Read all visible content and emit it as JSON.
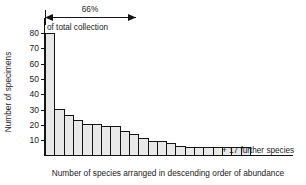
{
  "chart_data": {
    "type": "bar",
    "title": "",
    "xlabel": "Number of species arranged in descending order of abundance",
    "ylabel": "Number of specimens",
    "ylim": [
      0,
      84
    ],
    "xlim": [
      0,
      24
    ],
    "grid": false,
    "legend": null,
    "yticks": [
      10,
      20,
      30,
      40,
      50,
      60,
      70,
      80
    ],
    "ytick_labels": [
      "10",
      "20",
      "30",
      "40",
      "50",
      "60",
      "70",
      "80"
    ],
    "xtick_labels": [],
    "categories": [
      "1",
      "2",
      "3",
      "4",
      "5",
      "6",
      "7",
      "8",
      "9",
      "10",
      "11",
      "12",
      "13",
      "14",
      "15",
      "16",
      "17",
      "18",
      "19",
      "20",
      "21",
      "22"
    ],
    "values": [
      80,
      30,
      26,
      23,
      20,
      20,
      19,
      19,
      16,
      14,
      11,
      9,
      9,
      8,
      6,
      5,
      5,
      5,
      5,
      5,
      5,
      5
    ],
    "bar_color": "#e8e8e8",
    "bar_edge_color": "#141414",
    "annotations": [
      {
        "name": "percent-span",
        "text": "66%",
        "sub_text": "of total collection",
        "span_from_category": "1",
        "span_to_category": "6",
        "style": "double-headed-arrow"
      },
      {
        "name": "tail-note",
        "text": "+ 17 further species",
        "anchor_category": "22"
      }
    ]
  },
  "axis": {
    "y_title": "Number of specimens",
    "x_title": "Number of species arranged in descending order of abundance"
  },
  "annotation_top": {
    "percent_label": "66%",
    "subtitle": "of total collection"
  },
  "annotation_tail": {
    "label": "+ 17 further species"
  },
  "colors": {
    "bar_fill": "#e8e8e8",
    "ink": "#141414",
    "background": "#ffffff"
  }
}
